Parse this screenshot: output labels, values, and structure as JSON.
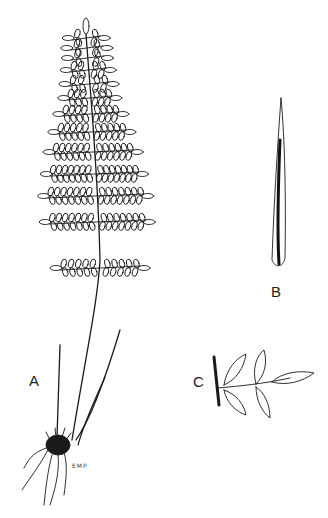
{
  "figure": {
    "type": "botanical line drawing",
    "panels": [
      {
        "id": "A",
        "label": "A",
        "description": "whole plant: pinnate frond on long stipe, several bare stipes, rhizome with roots"
      },
      {
        "id": "B",
        "label": "B",
        "description": "scale (elongate, tapering, dark central stripe)"
      },
      {
        "id": "C",
        "label": "C",
        "description": "single pinna segment with leaflets attached to rachis"
      }
    ],
    "signature": "EMP",
    "ink_color": "#1a1a1a",
    "background": "#ffffff"
  }
}
